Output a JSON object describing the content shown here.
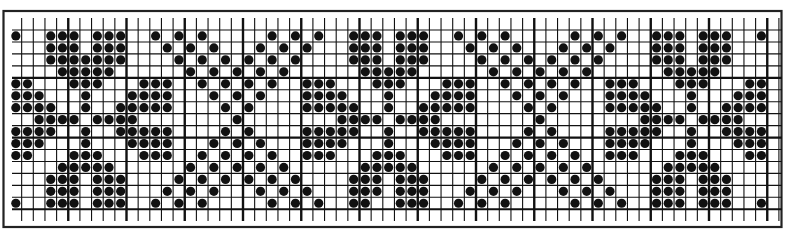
{
  "chart_data": {
    "type": "heatmap",
    "title": "",
    "grid": {
      "columns": 66,
      "rows": 15,
      "major_line_every": 5,
      "major_horizontal_rows": [
        4,
        9,
        15
      ]
    },
    "colors": {
      "ink": "#111111",
      "background": "#ffffff"
    },
    "dot_rows": [
      [
        0,
        3,
        4,
        5,
        7,
        8,
        9,
        12,
        14,
        16,
        22,
        24,
        26,
        29,
        30,
        31,
        33,
        34,
        35,
        38,
        40,
        42,
        48,
        50,
        52,
        55,
        56,
        57,
        59,
        60,
        61,
        64
      ],
      [
        3,
        4,
        5,
        7,
        8,
        9,
        13,
        15,
        17,
        21,
        23,
        25,
        29,
        30,
        31,
        33,
        34,
        35,
        39,
        41,
        43,
        47,
        49,
        51,
        55,
        56,
        57,
        59,
        60,
        61
      ],
      [
        3,
        4,
        5,
        6,
        7,
        8,
        9,
        14,
        16,
        18,
        20,
        22,
        24,
        29,
        30,
        31,
        33,
        34,
        35,
        40,
        42,
        44,
        46,
        48,
        50,
        55,
        56,
        57,
        59,
        60,
        61
      ],
      [
        4,
        5,
        6,
        7,
        8,
        15,
        17,
        19,
        21,
        23,
        30,
        31,
        32,
        33,
        34,
        41,
        43,
        45,
        47,
        49,
        56,
        57,
        58,
        59,
        60
      ],
      [
        0,
        1,
        5,
        6,
        7,
        11,
        12,
        13,
        16,
        18,
        20,
        22,
        25,
        26,
        27,
        31,
        32,
        33,
        37,
        38,
        39,
        42,
        44,
        46,
        48,
        51,
        52,
        53,
        57,
        58,
        59,
        63,
        64
      ],
      [
        0,
        1,
        2,
        6,
        10,
        11,
        12,
        13,
        17,
        19,
        21,
        25,
        26,
        27,
        28,
        32,
        36,
        37,
        38,
        39,
        43,
        45,
        47,
        51,
        52,
        53,
        54,
        58,
        62,
        63,
        64
      ],
      [
        0,
        1,
        2,
        3,
        6,
        9,
        10,
        11,
        12,
        13,
        18,
        20,
        25,
        26,
        27,
        28,
        29,
        32,
        35,
        36,
        37,
        38,
        39,
        44,
        46,
        51,
        52,
        53,
        54,
        55,
        58,
        61,
        62,
        63,
        64
      ],
      [
        2,
        3,
        4,
        5,
        7,
        8,
        9,
        10,
        19,
        28,
        29,
        30,
        31,
        33,
        34,
        35,
        36,
        45,
        54,
        55,
        56,
        57,
        59,
        60,
        61,
        62
      ],
      [
        0,
        1,
        2,
        3,
        6,
        9,
        10,
        11,
        12,
        13,
        18,
        20,
        25,
        26,
        27,
        28,
        29,
        32,
        35,
        36,
        37,
        38,
        39,
        44,
        46,
        51,
        52,
        53,
        54,
        55,
        58,
        61,
        62,
        63,
        64
      ],
      [
        0,
        1,
        2,
        6,
        10,
        11,
        12,
        13,
        17,
        19,
        21,
        25,
        26,
        27,
        28,
        32,
        36,
        37,
        38,
        39,
        43,
        45,
        47,
        51,
        52,
        53,
        54,
        58,
        62,
        63,
        64
      ],
      [
        0,
        1,
        5,
        6,
        7,
        11,
        12,
        13,
        16,
        18,
        20,
        22,
        25,
        26,
        27,
        31,
        32,
        33,
        37,
        38,
        39,
        42,
        44,
        46,
        48,
        51,
        52,
        53,
        57,
        58,
        59,
        63,
        64
      ],
      [
        4,
        5,
        6,
        7,
        8,
        15,
        17,
        19,
        21,
        23,
        30,
        31,
        32,
        33,
        34,
        41,
        43,
        45,
        47,
        49,
        56,
        57,
        58,
        59,
        60
      ],
      [
        3,
        4,
        5,
        7,
        8,
        9,
        14,
        16,
        18,
        20,
        22,
        24,
        29,
        30,
        31,
        33,
        34,
        35,
        40,
        42,
        44,
        46,
        48,
        50,
        55,
        56,
        57,
        59,
        60,
        61
      ],
      [
        3,
        4,
        5,
        7,
        8,
        9,
        13,
        15,
        17,
        21,
        23,
        25,
        29,
        30,
        31,
        33,
        34,
        35,
        39,
        41,
        43,
        47,
        49,
        51,
        55,
        56,
        57,
        59,
        60,
        61
      ],
      [
        0,
        3,
        4,
        5,
        7,
        8,
        9,
        12,
        14,
        16,
        22,
        24,
        26,
        29,
        30,
        33,
        34,
        35,
        38,
        40,
        42,
        48,
        50,
        52,
        55,
        56,
        57,
        59,
        60,
        61,
        64
      ]
    ],
    "legend": [],
    "xlabel": "",
    "ylabel": ""
  }
}
